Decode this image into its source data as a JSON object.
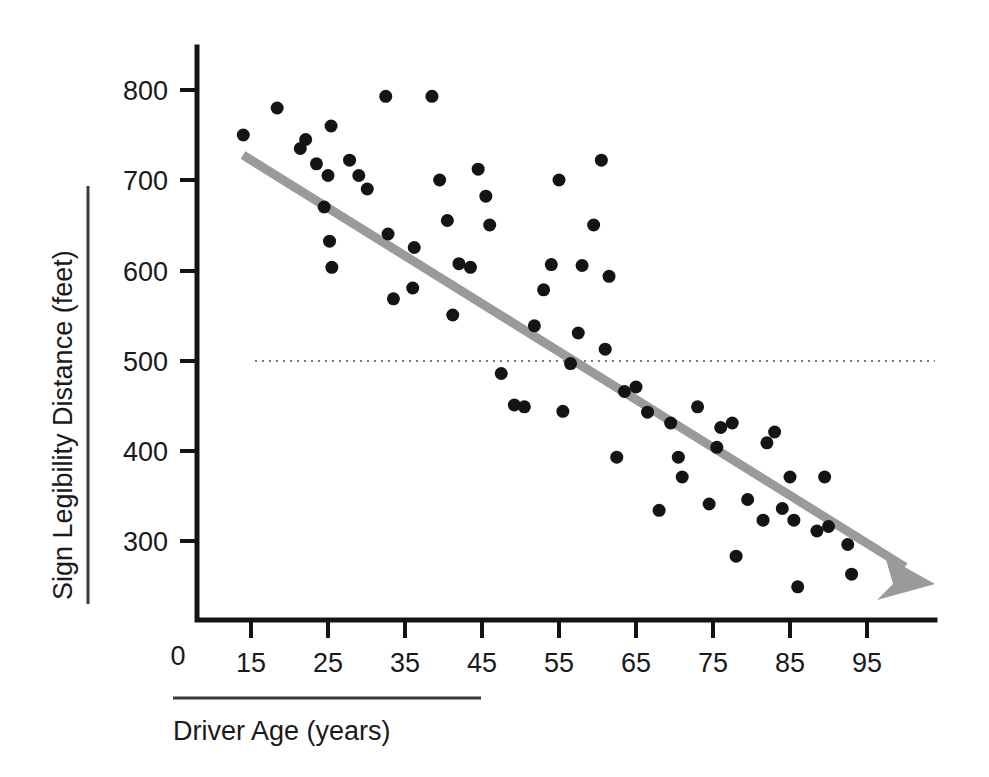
{
  "chart_data": {
    "type": "scatter",
    "title": "",
    "subtitle": "",
    "xlabel": "Driver Age (years)",
    "ylabel": "Sign Legibility Distance (feet)",
    "xlim": [
      10,
      103
    ],
    "ylim": [
      200,
      830
    ],
    "grid": false,
    "legend": null,
    "x_ticks": [
      "15",
      "25",
      "35",
      "45",
      "55",
      "65",
      "75",
      "85",
      "95"
    ],
    "x_tick_values": [
      15,
      25,
      35,
      45,
      55,
      65,
      75,
      85,
      95
    ],
    "y_ticks": [
      "300",
      "400",
      "500",
      "600",
      "700",
      "800"
    ],
    "y_tick_values": [
      300,
      400,
      500,
      600,
      700,
      800
    ],
    "origin_label": "0",
    "annotations": [
      {
        "name": "reference-line-500",
        "type": "horizontal-dotted-line",
        "y": 500,
        "label": ""
      },
      {
        "name": "trend-line",
        "type": "regression-arrow",
        "x_start": 14,
        "y_start": 728,
        "x_end": 103,
        "y_end": 252,
        "color": "#9a9a9a"
      }
    ],
    "series": [
      {
        "name": "Drivers",
        "marker": "filled-circle",
        "color": "#141414",
        "points": [
          [
            14.0,
            750
          ],
          [
            18.4,
            780
          ],
          [
            21.4,
            735
          ],
          [
            22.1,
            745
          ],
          [
            23.5,
            718
          ],
          [
            25.4,
            760
          ],
          [
            25.0,
            705
          ],
          [
            24.5,
            670
          ],
          [
            25.2,
            632
          ],
          [
            25.5,
            603
          ],
          [
            27.8,
            722
          ],
          [
            29.0,
            705
          ],
          [
            30.1,
            690
          ],
          [
            32.5,
            793
          ],
          [
            32.8,
            640
          ],
          [
            33.5,
            568
          ],
          [
            36.2,
            625
          ],
          [
            36.0,
            580
          ],
          [
            39.5,
            700
          ],
          [
            38.5,
            793
          ],
          [
            40.5,
            655
          ],
          [
            41.2,
            550
          ],
          [
            42.0,
            607
          ],
          [
            43.5,
            603
          ],
          [
            44.5,
            712
          ],
          [
            45.5,
            682
          ],
          [
            46.0,
            650
          ],
          [
            47.5,
            485
          ],
          [
            49.2,
            450
          ],
          [
            50.5,
            448
          ],
          [
            51.8,
            538
          ],
          [
            53.0,
            578
          ],
          [
            54.0,
            606
          ],
          [
            55.0,
            700
          ],
          [
            55.5,
            443
          ],
          [
            56.5,
            496
          ],
          [
            57.5,
            530
          ],
          [
            58.0,
            605
          ],
          [
            60.5,
            722
          ],
          [
            59.5,
            650
          ],
          [
            61.0,
            512
          ],
          [
            61.5,
            593
          ],
          [
            62.5,
            392
          ],
          [
            63.5,
            465
          ],
          [
            65.0,
            470
          ],
          [
            66.5,
            442
          ],
          [
            68.0,
            333
          ],
          [
            69.5,
            430
          ],
          [
            70.5,
            392
          ],
          [
            71.0,
            370
          ],
          [
            73.0,
            448
          ],
          [
            74.5,
            340
          ],
          [
            75.5,
            403
          ],
          [
            76.0,
            425
          ],
          [
            77.5,
            430
          ],
          [
            78.0,
            282
          ],
          [
            79.5,
            345
          ],
          [
            81.5,
            322
          ],
          [
            82.0,
            408
          ],
          [
            83.0,
            420
          ],
          [
            84.0,
            335
          ],
          [
            85.0,
            370
          ],
          [
            85.5,
            322
          ],
          [
            86.0,
            248
          ],
          [
            88.5,
            310
          ],
          [
            89.5,
            370
          ],
          [
            90.0,
            315
          ],
          [
            92.5,
            295
          ],
          [
            93.0,
            262
          ]
        ]
      }
    ]
  },
  "figure": {
    "background_color": "#ffffff",
    "point_color": "#141414",
    "trend_color": "#9a9a9a",
    "axis_color": "#141414"
  }
}
